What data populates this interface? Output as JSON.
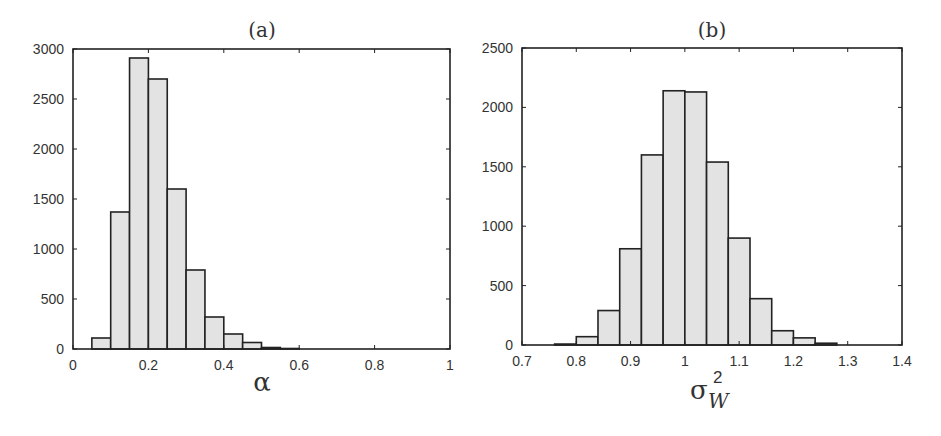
{
  "figure": {
    "background": "#ffffff",
    "bar_fill": "#e3e3e3",
    "bar_stroke": "#222222",
    "axis_color": "#222222"
  },
  "chart_data": [
    {
      "type": "bar",
      "subtype": "histogram",
      "panel": "(a)",
      "title": "(a)",
      "xlabel": "α",
      "ylabel": "",
      "xlim": [
        0,
        1
      ],
      "ylim": [
        0,
        3000
      ],
      "xticks": [
        0,
        0.2,
        0.4,
        0.6,
        0.8,
        1
      ],
      "xtick_labels": [
        "0",
        "0.2",
        "0.4",
        "0.6",
        "0.8",
        "1"
      ],
      "yticks": [
        0,
        500,
        1000,
        1500,
        2000,
        2500,
        3000
      ],
      "ytick_labels": [
        "0",
        "500",
        "1000",
        "1500",
        "2000",
        "2500",
        "3000"
      ],
      "grid": false,
      "bin_width": 0.05,
      "bin_edges": [
        0.05,
        0.1,
        0.15,
        0.2,
        0.25,
        0.3,
        0.35,
        0.4,
        0.45,
        0.5,
        0.55,
        0.6
      ],
      "values": [
        110,
        1370,
        2910,
        2700,
        1600,
        790,
        320,
        150,
        65,
        15,
        5
      ],
      "frame": {
        "left": 73,
        "top": 49,
        "right": 450,
        "bottom": 349
      }
    },
    {
      "type": "bar",
      "subtype": "histogram",
      "panel": "(b)",
      "title": "(b)",
      "xlabel": "σ",
      "xlabel_sup": "2",
      "xlabel_sub": "W",
      "ylabel": "",
      "xlim": [
        0.7,
        1.4
      ],
      "ylim": [
        0,
        2500
      ],
      "xticks": [
        0.7,
        0.8,
        0.9,
        1.0,
        1.1,
        1.2,
        1.3,
        1.4
      ],
      "xtick_labels": [
        "0.7",
        "0.8",
        "0.9",
        "1",
        "1.1",
        "1.2",
        "1.3",
        "1.4"
      ],
      "yticks": [
        0,
        500,
        1000,
        1500,
        2000,
        2500
      ],
      "ytick_labels": [
        "0",
        "500",
        "1000",
        "1500",
        "2000",
        "2500"
      ],
      "grid": false,
      "bin_width": 0.04,
      "bin_edges": [
        0.76,
        0.8,
        0.84,
        0.88,
        0.92,
        0.96,
        1.0,
        1.04,
        1.08,
        1.12,
        1.16,
        1.2,
        1.24,
        1.28
      ],
      "values": [
        8,
        70,
        290,
        810,
        1600,
        2140,
        2130,
        1540,
        900,
        390,
        120,
        60,
        15
      ],
      "frame": {
        "left": 522,
        "top": 48,
        "right": 902,
        "bottom": 345
      }
    }
  ]
}
